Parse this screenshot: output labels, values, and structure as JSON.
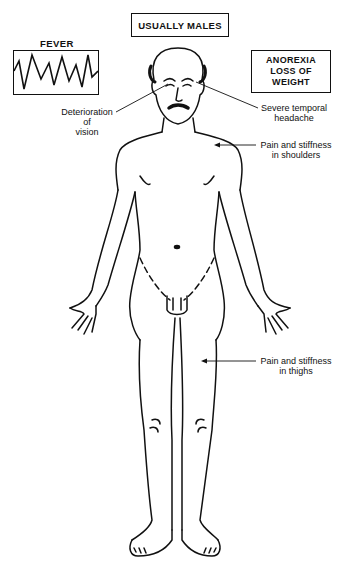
{
  "diagram": {
    "header_box": "USUALLY MALES",
    "fever": {
      "title": "FEVER",
      "icon": "fever-waveform-chart"
    },
    "right_box": {
      "line1": "ANOREXIA",
      "line2": "LOSS OF WEIGHT"
    },
    "annotations": {
      "vision": [
        "Deterioration",
        "of",
        "vision"
      ],
      "headache": [
        "Severe temporal",
        "headache"
      ],
      "shoulders": [
        "Pain and stiffness",
        "in shoulders"
      ],
      "thighs": [
        "Pain and stiffness",
        "in thighs"
      ]
    },
    "figure": "male-anatomy-front-view-illustration"
  }
}
